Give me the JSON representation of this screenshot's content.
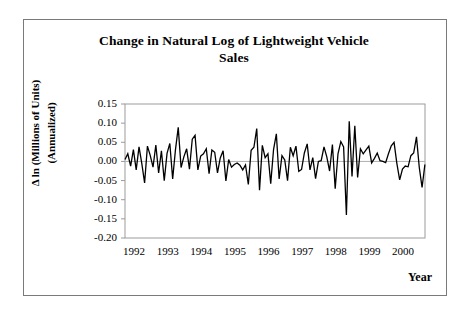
{
  "chart_data": {
    "type": "line",
    "title": "Change in Natural Log of Lightweight Vehicle Sales",
    "title_line1": "Change in Natural Log of Lightweight Vehicle",
    "title_line2": "Sales",
    "xlabel": "Year",
    "ylabel": "Δ ln (Millions of Units)",
    "ylabel_line2": "(Annualized)",
    "ylim": [
      -0.2,
      0.15
    ],
    "xlim": [
      1992.0,
      2000.92
    ],
    "ytick_labels": [
      "0.15",
      "0.10",
      "0.05",
      "0.00",
      "-0.05",
      "-0.10",
      "-0.15",
      "-0.20"
    ],
    "ytick_values": [
      0.15,
      0.1,
      0.05,
      0.0,
      -0.05,
      -0.1,
      -0.15,
      -0.2
    ],
    "xtick_labels": [
      "1992",
      "1993",
      "1994",
      "1995",
      "1996",
      "1997",
      "1998",
      "1999",
      "2000"
    ],
    "xtick_values": [
      1992,
      1993,
      1994,
      1995,
      1996,
      1997,
      1998,
      1999,
      2000
    ],
    "grid": false,
    "zero_line": 0.0,
    "line_color": "#000000",
    "frame_color": "#808080",
    "series": [
      {
        "name": "Change in natural log of lightweight vehicle sales",
        "x": [
          1992.0,
          1992.083,
          1992.167,
          1992.25,
          1992.333,
          1992.417,
          1992.5,
          1992.583,
          1992.667,
          1992.75,
          1992.833,
          1992.917,
          1993.0,
          1993.083,
          1993.167,
          1993.25,
          1993.333,
          1993.417,
          1993.5,
          1993.583,
          1993.667,
          1993.75,
          1993.833,
          1993.917,
          1994.0,
          1994.083,
          1994.167,
          1994.25,
          1994.333,
          1994.417,
          1994.5,
          1994.583,
          1994.667,
          1994.75,
          1994.833,
          1994.917,
          1995.0,
          1995.083,
          1995.167,
          1995.25,
          1995.333,
          1995.417,
          1995.5,
          1995.583,
          1995.667,
          1995.75,
          1995.833,
          1995.917,
          1996.0,
          1996.083,
          1996.167,
          1996.25,
          1996.333,
          1996.417,
          1996.5,
          1996.583,
          1996.667,
          1996.75,
          1996.833,
          1996.917,
          1997.0,
          1997.083,
          1997.167,
          1997.25,
          1997.333,
          1997.417,
          1997.5,
          1997.583,
          1997.667,
          1997.75,
          1997.833,
          1997.917,
          1998.0,
          1998.083,
          1998.167,
          1998.25,
          1998.333,
          1998.417,
          1998.5,
          1998.583,
          1998.667,
          1998.75,
          1998.833,
          1998.917,
          1999.0,
          1999.083,
          1999.167,
          1999.25,
          1999.333,
          1999.417,
          1999.5,
          1999.583,
          1999.667,
          1999.75,
          1999.833,
          1999.917,
          2000.0,
          2000.083,
          2000.167,
          2000.25,
          2000.333,
          2000.417,
          2000.5,
          2000.583,
          2000.667,
          2000.75,
          2000.833,
          2000.917
        ],
        "values": [
          0.005,
          0.02,
          -0.012,
          0.031,
          -0.022,
          0.038,
          -0.006,
          -0.056,
          0.04,
          0.016,
          -0.015,
          0.043,
          -0.03,
          0.028,
          -0.05,
          0.021,
          0.047,
          -0.046,
          0.03,
          0.089,
          -0.016,
          0.012,
          0.033,
          -0.02,
          0.058,
          0.068,
          -0.022,
          0.014,
          0.02,
          0.033,
          -0.032,
          0.03,
          0.024,
          -0.03,
          0.009,
          0.028,
          -0.051,
          0.005,
          -0.015,
          -0.008,
          -0.004,
          -0.01,
          -0.022,
          -0.009,
          -0.06,
          0.029,
          0.037,
          0.086,
          -0.075,
          0.042,
          0.01,
          0.02,
          -0.058,
          0.031,
          0.072,
          -0.046,
          0.015,
          0.004,
          -0.05,
          0.037,
          0.015,
          0.04,
          -0.026,
          -0.021,
          0.022,
          0.046,
          -0.022,
          0.01,
          -0.045,
          0.0,
          0.002,
          0.038,
          0.012,
          -0.025,
          0.044,
          -0.071,
          0.02,
          0.052,
          0.038,
          -0.14,
          0.105,
          -0.039,
          0.093,
          -0.042,
          0.033,
          0.02,
          0.03,
          0.04,
          -0.004,
          0.008,
          0.022,
          0.002,
          0.0,
          -0.003,
          0.02,
          0.041,
          0.05,
          -0.005,
          -0.048,
          -0.02,
          -0.012,
          -0.014,
          0.015,
          0.022,
          0.064,
          -0.016,
          -0.068,
          -0.008
        ]
      }
    ]
  },
  "figure": {
    "frame_label": "chart-frame"
  }
}
